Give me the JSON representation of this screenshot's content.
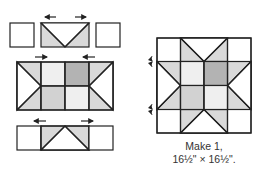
{
  "diagram": {
    "caption_line1": "Make 1,",
    "caption_line2": "16½\" × 16½\".",
    "colors": {
      "stroke": "#222222",
      "white": "#ffffff",
      "light_gray": "#d9d9d9",
      "very_light": "#efefef",
      "medium_gray": "#b3b3b3",
      "stripe_gray": "#d2d2d2"
    },
    "rows": [
      {
        "id": "top-row",
        "units": [
          "square",
          "flying-geese-down",
          "square"
        ],
        "press_arrows": [
          "left",
          "right"
        ]
      },
      {
        "id": "middle-unit",
        "units": [
          "star-point-left",
          "center-four-patch",
          "star-point-right"
        ],
        "press_arrows": [
          "right",
          "left"
        ]
      },
      {
        "id": "bottom-row",
        "units": [
          "square",
          "flying-geese-up",
          "square"
        ],
        "press_arrows": [
          "left",
          "right"
        ]
      }
    ],
    "finished_block": {
      "name": "sawtooth-star-block",
      "press_arrows": [
        "up-down",
        "up-down"
      ]
    }
  }
}
